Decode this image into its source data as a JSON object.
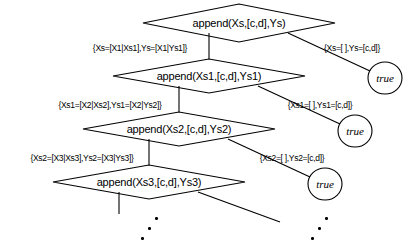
{
  "diagram": {
    "stroke_color": "#000000",
    "background_color": "#ffffff",
    "goal_nodes": [
      {
        "id": "goal-0",
        "text": "append(Xs,[c,d],Ys)",
        "cx": 239,
        "cy": 23,
        "rx": 96,
        "ry": 19
      },
      {
        "id": "goal-1",
        "text": "append(Xs1,[c,d],Ys1)",
        "cx": 209,
        "cy": 76,
        "rx": 96,
        "ry": 17
      },
      {
        "id": "goal-2",
        "text": "append(Xs2,[c,d],Ys2)",
        "cx": 179,
        "cy": 129,
        "rx": 96,
        "ry": 17
      },
      {
        "id": "goal-3",
        "text": "append(Xs3,[c,d],Ys3)",
        "cx": 149,
        "cy": 182,
        "rx": 96,
        "ry": 17
      }
    ],
    "leaf_nodes": [
      {
        "id": "leaf-0",
        "text": "true",
        "cx": 385,
        "cy": 78,
        "r": 17
      },
      {
        "id": "leaf-1",
        "text": "true",
        "cx": 355,
        "cy": 131,
        "r": 17
      },
      {
        "id": "leaf-2",
        "text": "true",
        "cx": 325,
        "cy": 184,
        "r": 17
      }
    ],
    "substitution_labels": [
      {
        "id": "sub-left-0",
        "text": "{Xs=[X1|Xs1],Ys=[X1|Ys1]}",
        "x": 140,
        "y": 48,
        "side": "left"
      },
      {
        "id": "sub-right-0",
        "text": "{Xs=[ ],Ys=[c,d]}",
        "x": 352,
        "y": 48,
        "side": "right"
      },
      {
        "id": "sub-left-1",
        "text": "{Xs1=[X2|Xs2],Ys1=[X2|Ys2]}",
        "x": 110,
        "y": 105,
        "side": "left"
      },
      {
        "id": "sub-right-1",
        "text": "{Xs1=[ ],Ys1=[c,d]}",
        "x": 320,
        "y": 105,
        "side": "right"
      },
      {
        "id": "sub-left-2",
        "text": "{Xs2=[X3|Xs3],Ys2=[X3|Ys3]}",
        "x": 82,
        "y": 158,
        "side": "left"
      },
      {
        "id": "sub-right-2",
        "text": "{Xs2=[ ],Ys2=[c,d]}",
        "x": 292,
        "y": 158,
        "side": "right"
      }
    ],
    "continuation_dots": [
      {
        "id": "dots-left",
        "cx": 152,
        "cy": 230
      },
      {
        "id": "dots-right",
        "cx": 322,
        "cy": 230
      }
    ]
  }
}
